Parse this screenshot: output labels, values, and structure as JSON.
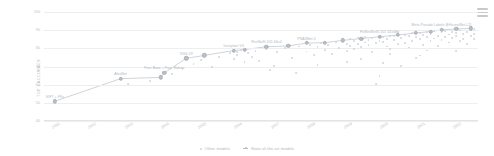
{
  "menu": {
    "icon": "hamburger-menu-icon"
  },
  "legend": {
    "position": "bottom-center",
    "items": [
      {
        "label": "Other models",
        "marker": "dot",
        "color": "#d2d6da"
      },
      {
        "label": "State-of-the-art models",
        "marker": "line-dot",
        "color": "#bcc2c8"
      }
    ]
  },
  "chart_data": {
    "type": "scatter",
    "title": "",
    "xlabel": "",
    "ylabel": "TOP 1 ACCURACY",
    "xlim": [
      2010.7,
      2022.6
    ],
    "ylim": [
      40,
      100
    ],
    "grid": true,
    "yticks": [
      40,
      50,
      60,
      70,
      80,
      90,
      100
    ],
    "xticks": [
      2011,
      2012,
      2013,
      2014,
      2015,
      2016,
      2017,
      2018,
      2019,
      2020,
      2021,
      2022
    ],
    "series": [
      {
        "name": "State-of-the-art models",
        "color": "#bcc2c8",
        "points": [
          {
            "x": 2011.0,
            "y": 50.9,
            "label": "SIFT + FVs"
          },
          {
            "x": 2012.8,
            "y": 63.3,
            "label": "AlexNet"
          },
          {
            "x": 2013.9,
            "y": 64.0,
            "label": ""
          },
          {
            "x": 2014.0,
            "y": 66.5,
            "label": "Four Base + Four Halves"
          },
          {
            "x": 2014.6,
            "y": 74.5,
            "label": "VGG-19"
          },
          {
            "x": 2015.1,
            "y": 76.1,
            "label": ""
          },
          {
            "x": 2015.9,
            "y": 78.8,
            "label": "Inception V3"
          },
          {
            "x": 2016.2,
            "y": 79.3,
            "label": ""
          },
          {
            "x": 2016.8,
            "y": 80.9,
            "label": "ResNeXt-101 64x4"
          },
          {
            "x": 2017.4,
            "y": 81.3,
            "label": ""
          },
          {
            "x": 2017.9,
            "y": 82.9,
            "label": "PNASNet-5"
          },
          {
            "x": 2018.4,
            "y": 83.1,
            "label": ""
          },
          {
            "x": 2018.9,
            "y": 84.4,
            "label": ""
          },
          {
            "x": 2019.4,
            "y": 85.4,
            "label": ""
          },
          {
            "x": 2019.9,
            "y": 86.4,
            "label": "FixResNeXt-101 32x48d"
          },
          {
            "x": 2020.4,
            "y": 87.3,
            "label": ""
          },
          {
            "x": 2020.9,
            "y": 88.5,
            "label": ""
          },
          {
            "x": 2021.3,
            "y": 89.2,
            "label": ""
          },
          {
            "x": 2021.6,
            "y": 90.2,
            "label": "Meta Pseudo Labels (EfficientNet-L2)"
          },
          {
            "x": 2022.0,
            "y": 90.6,
            "label": ""
          },
          {
            "x": 2022.4,
            "y": 91.0,
            "label": ""
          }
        ]
      },
      {
        "name": "Other models",
        "color": "#d2d6da",
        "points": [
          {
            "x": 2013.0,
            "y": 60.2
          },
          {
            "x": 2013.6,
            "y": 62.1
          },
          {
            "x": 2014.2,
            "y": 65.8
          },
          {
            "x": 2014.5,
            "y": 68.4
          },
          {
            "x": 2014.8,
            "y": 71.2
          },
          {
            "x": 2015.0,
            "y": 73.4
          },
          {
            "x": 2015.3,
            "y": 69.8
          },
          {
            "x": 2015.5,
            "y": 75.1
          },
          {
            "x": 2015.8,
            "y": 77.2
          },
          {
            "x": 2015.9,
            "y": 74.0
          },
          {
            "x": 2016.0,
            "y": 78.1
          },
          {
            "x": 2016.0,
            "y": 76.3
          },
          {
            "x": 2016.1,
            "y": 79.0
          },
          {
            "x": 2016.2,
            "y": 72.5
          },
          {
            "x": 2016.3,
            "y": 77.5
          },
          {
            "x": 2016.4,
            "y": 75.0
          },
          {
            "x": 2016.5,
            "y": 78.6
          },
          {
            "x": 2016.6,
            "y": 73.2
          },
          {
            "x": 2016.8,
            "y": 79.4
          },
          {
            "x": 2017.0,
            "y": 70.1
          },
          {
            "x": 2017.1,
            "y": 77.8
          },
          {
            "x": 2017.3,
            "y": 80.2
          },
          {
            "x": 2017.5,
            "y": 74.6
          },
          {
            "x": 2017.7,
            "y": 81.0
          },
          {
            "x": 2017.9,
            "y": 78.2
          },
          {
            "x": 2018.0,
            "y": 82.0
          },
          {
            "x": 2018.1,
            "y": 76.4
          },
          {
            "x": 2018.2,
            "y": 80.5
          },
          {
            "x": 2018.3,
            "y": 83.0
          },
          {
            "x": 2018.4,
            "y": 79.1
          },
          {
            "x": 2018.5,
            "y": 81.8
          },
          {
            "x": 2018.6,
            "y": 77.0
          },
          {
            "x": 2018.7,
            "y": 83.4
          },
          {
            "x": 2018.8,
            "y": 80.0
          },
          {
            "x": 2018.9,
            "y": 84.0
          },
          {
            "x": 2019.0,
            "y": 78.5
          },
          {
            "x": 2019.0,
            "y": 82.6
          },
          {
            "x": 2019.1,
            "y": 85.0
          },
          {
            "x": 2019.1,
            "y": 81.2
          },
          {
            "x": 2019.2,
            "y": 83.8
          },
          {
            "x": 2019.2,
            "y": 79.6
          },
          {
            "x": 2019.3,
            "y": 85.5
          },
          {
            "x": 2019.3,
            "y": 82.2
          },
          {
            "x": 2019.4,
            "y": 84.4
          },
          {
            "x": 2019.4,
            "y": 80.8
          },
          {
            "x": 2019.5,
            "y": 86.0
          },
          {
            "x": 2019.5,
            "y": 83.2
          },
          {
            "x": 2019.6,
            "y": 81.6
          },
          {
            "x": 2019.6,
            "y": 84.8
          },
          {
            "x": 2019.7,
            "y": 78.0
          },
          {
            "x": 2019.7,
            "y": 85.8
          },
          {
            "x": 2019.8,
            "y": 82.8
          },
          {
            "x": 2019.8,
            "y": 60.5
          },
          {
            "x": 2019.9,
            "y": 84.2
          },
          {
            "x": 2019.9,
            "y": 64.8
          },
          {
            "x": 2020.0,
            "y": 86.2
          },
          {
            "x": 2020.0,
            "y": 83.6
          },
          {
            "x": 2020.1,
            "y": 81.0
          },
          {
            "x": 2020.1,
            "y": 85.2
          },
          {
            "x": 2020.2,
            "y": 87.0
          },
          {
            "x": 2020.2,
            "y": 79.4
          },
          {
            "x": 2020.3,
            "y": 84.6
          },
          {
            "x": 2020.3,
            "y": 86.6
          },
          {
            "x": 2020.4,
            "y": 82.4
          },
          {
            "x": 2020.4,
            "y": 88.0
          },
          {
            "x": 2020.5,
            "y": 85.6
          },
          {
            "x": 2020.5,
            "y": 70.2
          },
          {
            "x": 2020.6,
            "y": 87.4
          },
          {
            "x": 2020.6,
            "y": 83.0
          },
          {
            "x": 2020.7,
            "y": 86.8
          },
          {
            "x": 2020.7,
            "y": 80.4
          },
          {
            "x": 2020.8,
            "y": 88.2
          },
          {
            "x": 2020.8,
            "y": 84.0
          },
          {
            "x": 2020.9,
            "y": 86.0
          },
          {
            "x": 2020.9,
            "y": 74.5
          },
          {
            "x": 2021.0,
            "y": 88.6
          },
          {
            "x": 2021.0,
            "y": 85.0
          },
          {
            "x": 2021.1,
            "y": 87.2
          },
          {
            "x": 2021.1,
            "y": 82.0
          },
          {
            "x": 2021.2,
            "y": 89.0
          },
          {
            "x": 2021.2,
            "y": 86.4
          },
          {
            "x": 2021.3,
            "y": 83.8
          },
          {
            "x": 2021.3,
            "y": 88.0
          },
          {
            "x": 2021.4,
            "y": 85.4
          },
          {
            "x": 2021.4,
            "y": 89.4
          },
          {
            "x": 2021.5,
            "y": 87.0
          },
          {
            "x": 2021.5,
            "y": 81.4
          },
          {
            "x": 2021.6,
            "y": 88.8
          },
          {
            "x": 2021.6,
            "y": 84.6
          },
          {
            "x": 2021.7,
            "y": 86.2
          },
          {
            "x": 2021.7,
            "y": 89.6
          },
          {
            "x": 2021.8,
            "y": 83.2
          },
          {
            "x": 2021.8,
            "y": 87.6
          },
          {
            "x": 2021.9,
            "y": 85.8
          },
          {
            "x": 2021.9,
            "y": 89.2
          },
          {
            "x": 2022.0,
            "y": 88.4
          },
          {
            "x": 2022.0,
            "y": 86.6
          },
          {
            "x": 2022.1,
            "y": 84.2
          },
          {
            "x": 2022.1,
            "y": 89.8
          },
          {
            "x": 2022.2,
            "y": 87.8
          },
          {
            "x": 2022.2,
            "y": 85.2
          },
          {
            "x": 2022.3,
            "y": 88.9
          },
          {
            "x": 2022.3,
            "y": 82.6
          },
          {
            "x": 2022.4,
            "y": 90.1
          },
          {
            "x": 2022.4,
            "y": 86.9
          },
          {
            "x": 2022.5,
            "y": 88.1
          },
          {
            "x": 2022.5,
            "y": 84.9
          },
          {
            "x": 2022.5,
            "y": 90.4
          },
          {
            "x": 2016.9,
            "y": 68.2
          },
          {
            "x": 2017.6,
            "y": 66.4
          },
          {
            "x": 2018.2,
            "y": 70.8
          },
          {
            "x": 2019.0,
            "y": 72.4
          },
          {
            "x": 2020.0,
            "y": 72.0
          },
          {
            "x": 2021.0,
            "y": 76.0
          },
          {
            "x": 2022.0,
            "y": 78.4
          },
          {
            "x": 2021.2,
            "y": 78.8
          },
          {
            "x": 2020.2,
            "y": 76.8
          },
          {
            "x": 2019.4,
            "y": 74.2
          }
        ]
      }
    ]
  }
}
